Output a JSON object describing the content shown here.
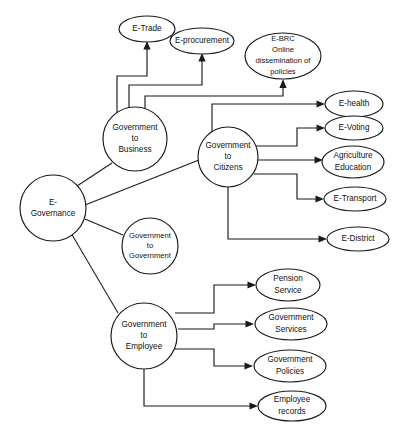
{
  "diagram": {
    "type": "node-link-tree",
    "stroke_color": "#1a1a1a",
    "fill_color": "#ffffff",
    "root": {
      "id": "e-governance",
      "label_lines": [
        "E-",
        "Governance"
      ],
      "shape": "circle"
    },
    "branches": [
      {
        "id": "government-to-business",
        "label_lines": [
          "Government",
          "to",
          "Business"
        ],
        "shape": "circle",
        "children": [
          {
            "id": "e-trade",
            "label_lines": [
              "E-Trade"
            ],
            "shape": "ellipse"
          },
          {
            "id": "e-procurement",
            "label_lines": [
              "E-procurement"
            ],
            "shape": "ellipse"
          },
          {
            "id": "e-brc",
            "label_lines": [
              "E-BRC",
              "Online",
              "dissemination of",
              "policies"
            ],
            "shape": "ellipse"
          }
        ]
      },
      {
        "id": "government-to-citizens",
        "label_lines": [
          "Government",
          "to",
          "Citizens"
        ],
        "shape": "circle",
        "children": [
          {
            "id": "e-health",
            "label_lines": [
              "E-health"
            ],
            "shape": "ellipse"
          },
          {
            "id": "e-voting",
            "label_lines": [
              "E-Voting"
            ],
            "shape": "ellipse"
          },
          {
            "id": "agriculture-education",
            "label_lines": [
              "Agriculture",
              "Education"
            ],
            "shape": "ellipse"
          },
          {
            "id": "e-transport",
            "label_lines": [
              "E-Transport"
            ],
            "shape": "ellipse"
          },
          {
            "id": "e-district",
            "label_lines": [
              "E-District"
            ],
            "shape": "ellipse"
          }
        ]
      },
      {
        "id": "government-to-government",
        "label_lines": [
          "Government",
          "to",
          "Government"
        ],
        "shape": "circle",
        "children": []
      },
      {
        "id": "government-to-employee",
        "label_lines": [
          "Government",
          "to",
          "Employee"
        ],
        "shape": "circle",
        "children": [
          {
            "id": "pension-service",
            "label_lines": [
              "Pension",
              "Service"
            ],
            "shape": "ellipse"
          },
          {
            "id": "government-services",
            "label_lines": [
              "Government",
              "Services"
            ],
            "shape": "ellipse"
          },
          {
            "id": "government-policies",
            "label_lines": [
              "Government",
              "Policies"
            ],
            "shape": "ellipse"
          },
          {
            "id": "employee-records",
            "label_lines": [
              "Employee",
              "records"
            ],
            "shape": "ellipse"
          }
        ]
      }
    ]
  },
  "labels": {
    "e_governance_1": "E-",
    "e_governance_2": "Governance",
    "g2b_1": "Government",
    "g2b_2": "to",
    "g2b_3": "Business",
    "g2c_1": "Government",
    "g2c_2": "to",
    "g2c_3": "Citizens",
    "g2g_1": "Government",
    "g2g_2": "to",
    "g2g_3": "Government",
    "g2e_1": "Government",
    "g2e_2": "to",
    "g2e_3": "Employee",
    "e_trade": "E-Trade",
    "e_procurement": "E-procurement",
    "e_brc_1": "E-BRC",
    "e_brc_2": "Online",
    "e_brc_3": "dissemination of",
    "e_brc_4": "policies",
    "e_health": "E-health",
    "e_voting": "E-Voting",
    "agriculture_1": "Agriculture",
    "agriculture_2": "Education",
    "e_transport": "E-Transport",
    "e_district": "E-District",
    "pension_1": "Pension",
    "pension_2": "Service",
    "gov_services_1": "Government",
    "gov_services_2": "Services",
    "gov_policies_1": "Government",
    "gov_policies_2": "Policies",
    "employee_records_1": "Employee",
    "employee_records_2": "records"
  }
}
